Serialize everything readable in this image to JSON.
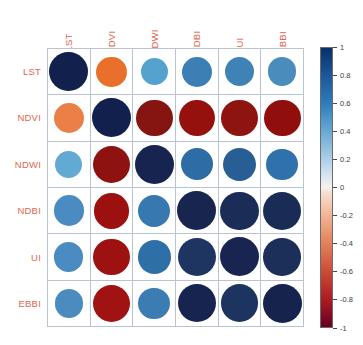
{
  "chart_data": {
    "type": "heatmap",
    "title": "",
    "subtitle": "",
    "xlabel": "",
    "ylabel": "",
    "variant": "correlation-matrix-circles",
    "categories": [
      "LST",
      "NDVI",
      "NDWI",
      "NDBI",
      "UI",
      "EBBI"
    ],
    "x_tick_labels": [
      "LST",
      "NDVI",
      "NDWI",
      "NDBI",
      "UI",
      "EBBI"
    ],
    "y_tick_labels": [
      "LST",
      "NDVI",
      "NDWI",
      "NDBI",
      "UI",
      "EBBI"
    ],
    "grid": true,
    "legend_position": "right",
    "colorbar": {
      "min": -1,
      "max": 1,
      "tick_labels": [
        "1",
        "0.8",
        "0.6",
        "0.4",
        "0.2",
        "0",
        "-0.2",
        "-0.4",
        "-0.6",
        "-0.8",
        "-1"
      ],
      "tick_values": [
        1,
        0.8,
        0.6,
        0.4,
        0.2,
        0,
        -0.2,
        -0.4,
        -0.6,
        -0.8,
        -1
      ],
      "high_color": "#08306b",
      "mid_color": "#f7f2ec",
      "low_color": "#67001f"
    },
    "matrix": [
      [
        1.0,
        -0.55,
        0.42,
        0.55,
        0.5,
        0.48
      ],
      [
        -0.55,
        1.0,
        -0.88,
        -0.82,
        -0.85,
        -0.88
      ],
      [
        0.42,
        -0.88,
        1.0,
        0.62,
        0.68,
        0.6
      ],
      [
        0.55,
        -0.82,
        0.62,
        1.0,
        0.95,
        0.95
      ],
      [
        0.5,
        -0.85,
        0.68,
        0.95,
        1.0,
        0.92
      ],
      [
        0.48,
        -0.88,
        0.6,
        0.95,
        0.92,
        1.0
      ]
    ],
    "cells": [
      {
        "row": "LST",
        "col": "LST",
        "value": 1.0,
        "color": "#12204e"
      },
      {
        "row": "LST",
        "col": "NDVI",
        "value": -0.55,
        "color": "#e8702a"
      },
      {
        "row": "LST",
        "col": "NDWI",
        "value": 0.42,
        "color": "#56a2cf"
      },
      {
        "row": "LST",
        "col": "NDBI",
        "value": 0.55,
        "color": "#3b7fb4"
      },
      {
        "row": "LST",
        "col": "UI",
        "value": 0.5,
        "color": "#3f83b6"
      },
      {
        "row": "LST",
        "col": "EBBI",
        "value": 0.48,
        "color": "#4a8cbc"
      },
      {
        "row": "NDVI",
        "col": "LST",
        "value": -0.55,
        "color": "#ea7f48"
      },
      {
        "row": "NDVI",
        "col": "NDVI",
        "value": 1.0,
        "color": "#12204e"
      },
      {
        "row": "NDVI",
        "col": "NDWI",
        "value": -0.88,
        "color": "#861410"
      },
      {
        "row": "NDVI",
        "col": "NDBI",
        "value": -0.82,
        "color": "#94110e"
      },
      {
        "row": "NDVI",
        "col": "UI",
        "value": -0.85,
        "color": "#8e1410"
      },
      {
        "row": "NDVI",
        "col": "EBBI",
        "value": -0.88,
        "color": "#900f0d"
      },
      {
        "row": "NDWI",
        "col": "LST",
        "value": 0.42,
        "color": "#62aad4"
      },
      {
        "row": "NDWI",
        "col": "NDVI",
        "value": -0.88,
        "color": "#8e1210"
      },
      {
        "row": "NDWI",
        "col": "NDWI",
        "value": 1.0,
        "color": "#16244f"
      },
      {
        "row": "NDWI",
        "col": "NDBI",
        "value": 0.62,
        "color": "#2d6ca5"
      },
      {
        "row": "NDWI",
        "col": "UI",
        "value": 0.68,
        "color": "#275f94"
      },
      {
        "row": "NDWI",
        "col": "EBBI",
        "value": 0.6,
        "color": "#2f72ab"
      },
      {
        "row": "NDBI",
        "col": "LST",
        "value": 0.55,
        "color": "#4a8cc2"
      },
      {
        "row": "NDBI",
        "col": "NDVI",
        "value": -0.82,
        "color": "#9c1110"
      },
      {
        "row": "NDBI",
        "col": "NDWI",
        "value": 0.62,
        "color": "#3878b0"
      },
      {
        "row": "NDBI",
        "col": "NDBI",
        "value": 1.0,
        "color": "#18254f"
      },
      {
        "row": "NDBI",
        "col": "UI",
        "value": 0.95,
        "color": "#1b2c57"
      },
      {
        "row": "NDBI",
        "col": "EBBI",
        "value": 0.95,
        "color": "#1a2b55"
      },
      {
        "row": "UI",
        "col": "LST",
        "value": 0.5,
        "color": "#4a8cc2"
      },
      {
        "row": "UI",
        "col": "NDVI",
        "value": -0.85,
        "color": "#9d1211"
      },
      {
        "row": "UI",
        "col": "NDWI",
        "value": 0.68,
        "color": "#2f6fa8"
      },
      {
        "row": "UI",
        "col": "NDBI",
        "value": 0.95,
        "color": "#1d3560"
      },
      {
        "row": "UI",
        "col": "UI",
        "value": 1.0,
        "color": "#192550"
      },
      {
        "row": "UI",
        "col": "EBBI",
        "value": 0.92,
        "color": "#1c2f59"
      },
      {
        "row": "EBBI",
        "col": "LST",
        "value": 0.48,
        "color": "#4b8cc0"
      },
      {
        "row": "EBBI",
        "col": "NDVI",
        "value": -0.88,
        "color": "#a11312"
      },
      {
        "row": "EBBI",
        "col": "NDWI",
        "value": 0.6,
        "color": "#3b7cb2"
      },
      {
        "row": "EBBI",
        "col": "NDBI",
        "value": 0.95,
        "color": "#16244f"
      },
      {
        "row": "EBBI",
        "col": "UI",
        "value": 0.92,
        "color": "#1d3460"
      },
      {
        "row": "EBBI",
        "col": "EBBI",
        "value": 1.0,
        "color": "#16234d"
      }
    ]
  },
  "style": {
    "label_color": "#e0674e",
    "grid_line_color": "#b9c4d0",
    "background": "#ffffff",
    "tick_text_color": "#3c3c3c"
  }
}
